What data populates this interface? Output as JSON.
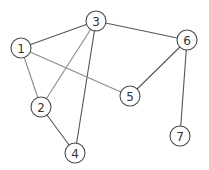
{
  "graph": {
    "node_radius": 10,
    "colors": {
      "background": "#ffffff",
      "node_fill": "#ffffff",
      "node_stroke": "#4a4a4a",
      "label": "#333333",
      "edge_dark": "#555555",
      "edge_light": "#8a8a8a"
    },
    "nodes": [
      {
        "id": "1",
        "label": "1",
        "x": 21,
        "y": 48
      },
      {
        "id": "2",
        "label": "2",
        "x": 41,
        "y": 107
      },
      {
        "id": "3",
        "label": "3",
        "x": 96,
        "y": 21
      },
      {
        "id": "4",
        "label": "4",
        "x": 75,
        "y": 153
      },
      {
        "id": "5",
        "label": "5",
        "x": 130,
        "y": 96
      },
      {
        "id": "6",
        "label": "6",
        "x": 187,
        "y": 40
      },
      {
        "id": "7",
        "label": "7",
        "x": 180,
        "y": 136
      }
    ],
    "edges": [
      {
        "from": "1",
        "to": "3",
        "tone": "dark"
      },
      {
        "from": "3",
        "to": "6",
        "tone": "dark"
      },
      {
        "from": "3",
        "to": "4",
        "tone": "dark"
      },
      {
        "from": "2",
        "to": "4",
        "tone": "dark"
      },
      {
        "from": "6",
        "to": "5",
        "tone": "dark"
      },
      {
        "from": "6",
        "to": "7",
        "tone": "dark"
      },
      {
        "from": "1",
        "to": "5",
        "tone": "light"
      },
      {
        "from": "1",
        "to": "2",
        "tone": "light"
      },
      {
        "from": "2",
        "to": "3",
        "tone": "light"
      }
    ]
  }
}
